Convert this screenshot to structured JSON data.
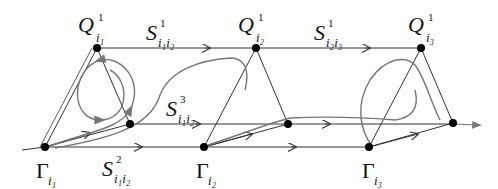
{
  "colors": {
    "line": "#333333",
    "flow": "#777777",
    "node": "#000000"
  },
  "labels": {
    "Q1": {
      "main": "Q",
      "sup": "1",
      "sub": "i₁"
    },
    "Q2": {
      "main": "Q",
      "sup": "1",
      "sub": "i₂"
    },
    "Q3": {
      "main": "Q",
      "sup": "1",
      "sub": "i₃"
    },
    "S12_1": {
      "main": "S",
      "sup": "1",
      "sub": "i₁i₂"
    },
    "S23_1": {
      "main": "S",
      "sup": "1",
      "sub": "i₂i₃"
    },
    "S12_3": {
      "main": "S",
      "sup": "3",
      "sub": "i₁i₂"
    },
    "S12_2": {
      "main": "S",
      "sup": "2",
      "sub": "i₁i₂"
    },
    "G1": {
      "main": "Γ",
      "sub": "i₁"
    },
    "G2": {
      "main": "Γ",
      "sub": "i₂"
    },
    "G3": {
      "main": "Γ",
      "sub": "i₃"
    }
  },
  "nodes": [
    {
      "id": "Q_i1",
      "x": 97,
      "y": 48
    },
    {
      "id": "Q_i2",
      "x": 256,
      "y": 48
    },
    {
      "id": "Q_i3",
      "x": 421,
      "y": 48
    },
    {
      "id": "mid_1",
      "x": 130,
      "y": 124
    },
    {
      "id": "mid_2",
      "x": 288,
      "y": 124
    },
    {
      "id": "mid_3",
      "x": 453,
      "y": 123
    },
    {
      "id": "Gamma_i1",
      "x": 45,
      "y": 147
    },
    {
      "id": "Gamma_i2",
      "x": 204,
      "y": 147
    },
    {
      "id": "Gamma_i3",
      "x": 369,
      "y": 147
    }
  ]
}
